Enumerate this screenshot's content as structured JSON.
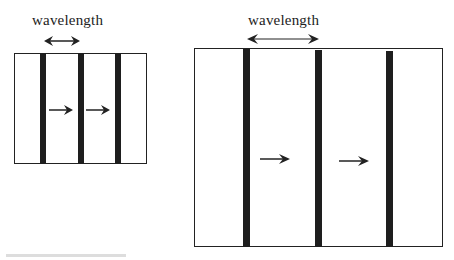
{
  "left_panel": {
    "label": "wavelength",
    "wavefront_count": 3,
    "propagation_arrows": 2,
    "arrow_direction": "right"
  },
  "right_panel": {
    "label": "wavelength",
    "wavefront_count": 3,
    "propagation_arrows": 2,
    "arrow_direction": "right"
  },
  "colors": {
    "wavefront": "#1e1e1e",
    "border": "#222222",
    "background": "#ffffff"
  }
}
